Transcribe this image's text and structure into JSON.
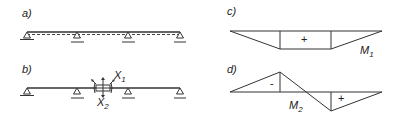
{
  "figure": {
    "panels": [
      {
        "id": "a",
        "label": "a)",
        "description": "Continuous beam on four supports with dashed deflection line"
      },
      {
        "id": "b",
        "label": "b)",
        "description": "Beam released at middle span with redundant forces",
        "redundants": [
          "X1",
          "X2"
        ]
      },
      {
        "id": "c",
        "label": "c)",
        "description": "Moment diagram M1",
        "sign": "+",
        "moment_label": "M",
        "moment_sub": "1"
      },
      {
        "id": "d",
        "label": "d)",
        "description": "Moment diagram M2",
        "signs": [
          "-",
          "+"
        ],
        "moment_label": "M",
        "moment_sub": "2"
      }
    ],
    "x1_main": "X",
    "x1_sub": "1",
    "x2_main": "X",
    "x2_sub": "2"
  },
  "colors": {
    "stroke": "#333333",
    "background": "#ffffff"
  }
}
